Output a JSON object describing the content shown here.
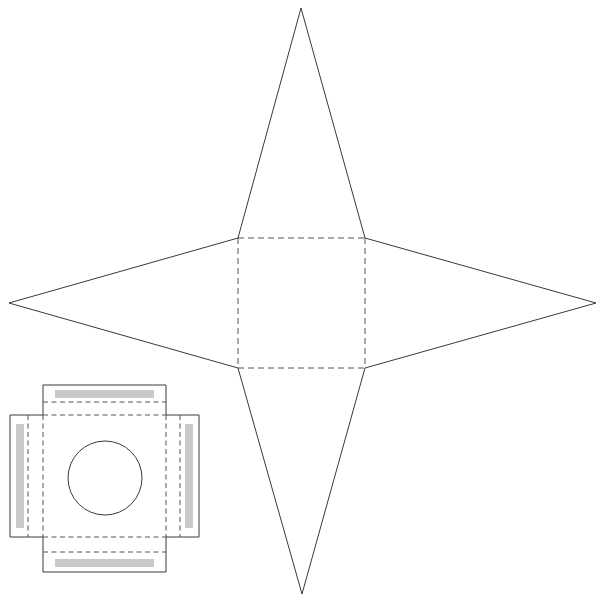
{
  "document": {
    "title": "Papercraft Nets Diagram",
    "background_color": "#ffffff",
    "width": 607,
    "height": 603
  },
  "style": {
    "cut_line_color": "#3a3a3a",
    "fold_line_color": "#555555",
    "glue_strip_color": "#c9c9c9",
    "panel_fill_color": "#ffffff",
    "cut_line_width": 1,
    "fold_dash_pattern": "6 4"
  },
  "figures": [
    {
      "id": "star-net",
      "name": "four-pointed-star-pyramid-net",
      "description": "Large four-pointed star net with central square base and four triangular flaps",
      "center_square": {
        "x": 238,
        "y": 238,
        "width": 127,
        "height": 130
      },
      "tips": {
        "top": {
          "x": 301,
          "y": 8
        },
        "bottom": {
          "x": 302,
          "y": 594
        },
        "left": {
          "x": 9,
          "y": 303
        },
        "right": {
          "x": 596,
          "y": 303
        }
      },
      "outline_points": "301,8 365,238 596,303 365,368 302,594 238,368 9,303 238,238",
      "fold_lines": [
        {
          "name": "fold-top",
          "from": [
            238,
            238
          ],
          "to": [
            365,
            238
          ]
        },
        {
          "name": "fold-right",
          "from": [
            365,
            238
          ],
          "to": [
            365,
            368
          ]
        },
        {
          "name": "fold-bottom",
          "from": [
            238,
            368
          ],
          "to": [
            365,
            368
          ]
        },
        {
          "name": "fold-left",
          "from": [
            238,
            238
          ],
          "to": [
            238,
            368
          ]
        }
      ]
    },
    {
      "id": "box-net",
      "name": "square-box-net-with-circular-aperture",
      "description": "Smaller cross-shaped box net with four flaps, gray glue strips and a circular window cut-out",
      "outline_path": "M 43,385 L 166,385 L 166,415 L 199,415 L 199,537 L 166,537 L 166,572 L 43,572 L 43,537 L 10,537 L 10,415 L 43,415 Z",
      "base_panel": {
        "x": 43,
        "y": 415,
        "width": 123,
        "height": 122
      },
      "aperture": {
        "cx": 105,
        "cy": 478,
        "r": 37,
        "name": "circular-window"
      },
      "glue_strips": [
        {
          "name": "glue-strip-top",
          "x": 55,
          "y": 390,
          "width": 99,
          "height": 8,
          "color": "#c9c9c9"
        },
        {
          "name": "glue-strip-bottom",
          "x": 55,
          "y": 559,
          "width": 99,
          "height": 8,
          "color": "#c9c9c9"
        },
        {
          "name": "glue-strip-left",
          "x": 16,
          "y": 424,
          "width": 8,
          "height": 104,
          "color": "#c9c9c9"
        },
        {
          "name": "glue-strip-right",
          "x": 185,
          "y": 424,
          "width": 8,
          "height": 104,
          "color": "#c9c9c9"
        }
      ],
      "fold_lines": [
        {
          "name": "fold-top-outer",
          "from": [
            43,
            402
          ],
          "to": [
            166,
            402
          ]
        },
        {
          "name": "fold-top-inner",
          "from": [
            43,
            415
          ],
          "to": [
            166,
            415
          ]
        },
        {
          "name": "fold-bottom-inner",
          "from": [
            43,
            537
          ],
          "to": [
            166,
            537
          ]
        },
        {
          "name": "fold-bottom-outer",
          "from": [
            43,
            552
          ],
          "to": [
            166,
            552
          ]
        },
        {
          "name": "fold-left-outer",
          "from": [
            28,
            415
          ],
          "to": [
            28,
            537
          ]
        },
        {
          "name": "fold-left-inner",
          "from": [
            43,
            415
          ],
          "to": [
            43,
            537
          ]
        },
        {
          "name": "fold-right-inner",
          "from": [
            166,
            415
          ],
          "to": [
            166,
            537
          ]
        },
        {
          "name": "fold-right-outer",
          "from": [
            180,
            415
          ],
          "to": [
            180,
            537
          ]
        }
      ]
    }
  ]
}
